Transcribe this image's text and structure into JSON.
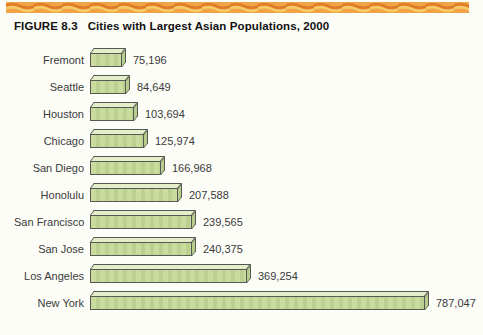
{
  "figure": {
    "label": "FIGURE 8.3",
    "title": "Cities with Largest Asian Populations, 2000"
  },
  "colors": {
    "band_background": "#f1a445",
    "band_wave_dark": "#dd7c28",
    "band_wave_light": "#f8cb6a",
    "bar_front": "#c9dc9e",
    "bar_top": "#e4eec9",
    "bar_side": "#b7cd8b",
    "bar_outline": "#565856"
  },
  "chart_data": {
    "type": "bar",
    "orientation": "horizontal",
    "title": "Cities with Largest Asian Populations, 2000",
    "categories": [
      "Fremont",
      "Seattle",
      "Houston",
      "Chicago",
      "San Diego",
      "Honolulu",
      "San Francisco",
      "San Jose",
      "Los Angeles",
      "New York"
    ],
    "values": [
      75196,
      84649,
      103694,
      125974,
      166968,
      207588,
      239565,
      240375,
      369254,
      787047
    ],
    "value_labels": [
      "75,196",
      "84,649",
      "103,694",
      "125,974",
      "166,968",
      "207,588",
      "239,565",
      "240,375",
      "369,254",
      "787,047"
    ],
    "xlim": [
      0,
      787047
    ],
    "grid": false,
    "legend": false,
    "bar_style": "3d-extruded-green",
    "value_label_position": "right-of-bar"
  }
}
